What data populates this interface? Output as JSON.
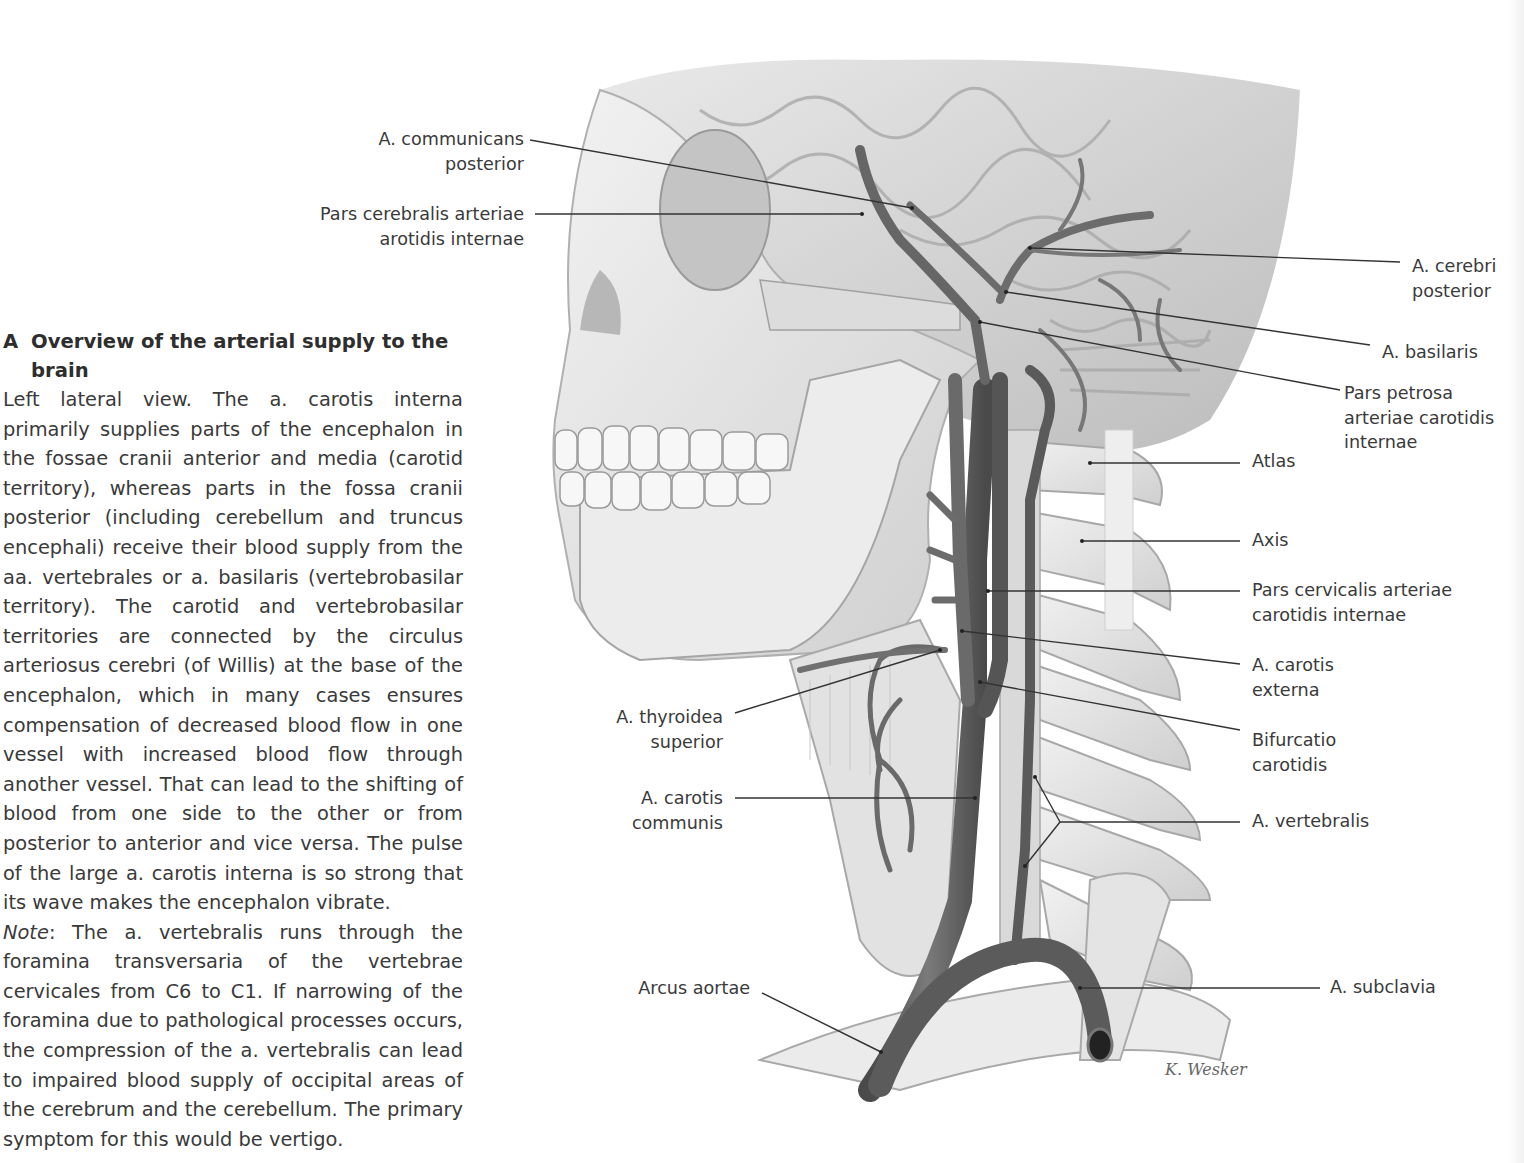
{
  "caption": {
    "letter": "A",
    "title": "Overview of the arterial supply to the brain",
    "paragraph": "Left lateral view. The a. carotis interna primarily supplies parts of the encephalon in the fossae cranii anterior and media (carotid territory), whereas parts in the fossa cranii posterior (including cerebellum and truncus encephali) receive their blood supply from the aa. vertebrales or a. basilaris (vertebrobasilar territory). The carotid and vertebrobasilar territories are connected by the circulus arteriosus cerebri (of Willis) at the base of the encephalon, which in many cases ensures compensation of decreased blood flow in one vessel with increased blood flow through another vessel. That can lead to the shifting of blood from one side to the other or from posterior to anterior and vice versa. The pulse of the large a. carotis interna is so strong that its wave makes the encephalon vibrate.",
    "note_label": "Note",
    "note_text": ": The a. vertebralis runs through the foramina transversaria of the vertebrae cervicales from C6 to C1. If narrowing of the foramina due to pathological processes occurs, the compression of the a. vertebralis can lead to impaired blood supply of occipital areas of the cerebrum and the cerebellum. The primary symptom for this would be vertigo."
  },
  "figure": {
    "signature": "K. Wesker",
    "colors": {
      "artery": "#5e5e5e",
      "bone": "#e6e6e6",
      "bone_shadow": "#bdbdbd",
      "brain": "#d6d6d6",
      "leader": "#333333",
      "text": "#3a3a3a"
    },
    "labels_left": [
      {
        "id": "a-communicans-posterior",
        "lines": [
          "A. communicans",
          "posterior"
        ]
      },
      {
        "id": "pars-cerebralis",
        "lines": [
          "Pars cerebralis arteriae",
          "arotidis internae"
        ]
      },
      {
        "id": "a-thyroidea-superior",
        "lines": [
          "A. thyroidea",
          "superior"
        ]
      },
      {
        "id": "a-carotis-communis",
        "lines": [
          "A. carotis",
          "communis"
        ]
      },
      {
        "id": "arcus-aortae",
        "lines": [
          "Arcus aortae"
        ]
      }
    ],
    "labels_right": [
      {
        "id": "a-cerebri-posterior",
        "lines": [
          "A. cerebri",
          "posterior"
        ]
      },
      {
        "id": "a-basilaris",
        "lines": [
          "A. basilaris"
        ]
      },
      {
        "id": "pars-petrosa",
        "lines": [
          "Pars petrosa",
          "arteriae carotidis",
          "internae"
        ]
      },
      {
        "id": "atlas",
        "lines": [
          "Atlas"
        ]
      },
      {
        "id": "axis",
        "lines": [
          "Axis"
        ]
      },
      {
        "id": "pars-cervicalis",
        "lines": [
          "Pars cervicalis arteriae",
          "carotidis internae"
        ]
      },
      {
        "id": "a-carotis-externa",
        "lines": [
          "A. carotis",
          "externa"
        ]
      },
      {
        "id": "bifurcatio-carotidis",
        "lines": [
          "Bifurcatio",
          "carotidis"
        ]
      },
      {
        "id": "a-vertebralis",
        "lines": [
          "A. vertebralis"
        ]
      },
      {
        "id": "a-subclavia",
        "lines": [
          "A. subclavia"
        ]
      }
    ]
  }
}
